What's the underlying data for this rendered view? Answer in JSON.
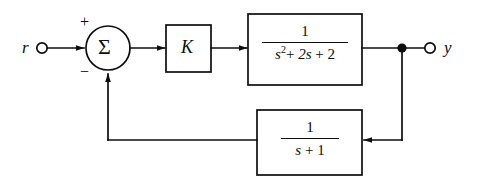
{
  "diagram": {
    "background_color": "#ffffff",
    "line_color": "#0d0d0d",
    "input": {
      "label": "r",
      "terminal": "open-circle"
    },
    "output": {
      "label": "y",
      "terminal": "open-circle"
    },
    "summing_junction": {
      "symbol": "Σ",
      "positive_sign": "+",
      "negative_sign": "−"
    },
    "gain_block": {
      "label": "K"
    },
    "plant_block": {
      "numerator": "1",
      "denominator_text": "s2 + 2s + 2",
      "den_s": "s",
      "den_exponent": "2",
      "den_plus_one": "+",
      "den_term_two": "2s",
      "den_plus_two": "+",
      "den_const": "2"
    },
    "feedback_block": {
      "numerator": "1",
      "denominator_text": "s + 1",
      "den_s": "s",
      "den_plus": "+",
      "den_const": "1"
    }
  }
}
